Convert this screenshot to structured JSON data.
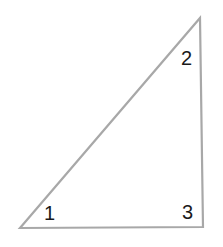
{
  "diagram": {
    "shape": "right-triangle",
    "stroke_color": "#a8a8a8",
    "fill_color": "#ffffff",
    "vertices": [
      {
        "x": 20,
        "y": 228
      },
      {
        "x": 200,
        "y": 18
      },
      {
        "x": 203,
        "y": 227
      }
    ],
    "angle_labels": [
      {
        "text": "1",
        "x": 44,
        "y": 220
      },
      {
        "text": "2",
        "x": 181,
        "y": 65
      },
      {
        "text": "3",
        "x": 182,
        "y": 219
      }
    ]
  }
}
